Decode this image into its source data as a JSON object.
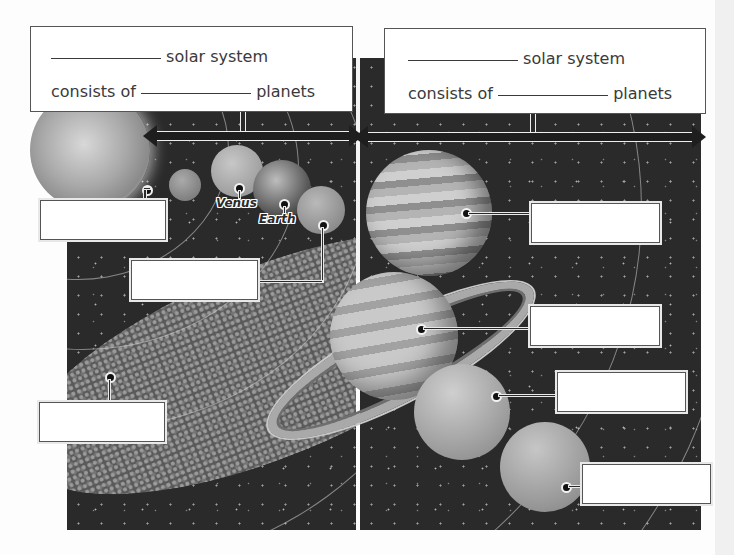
{
  "diagram": {
    "style": "grayscale worksheet",
    "headers": [
      {
        "id": "inner",
        "line1_text": "solar system",
        "line2_prefix": "consists of",
        "line2_suffix": "planets"
      },
      {
        "id": "outer",
        "line1_text": "solar system",
        "line2_prefix": "consists of",
        "line2_suffix": "planets"
      }
    ],
    "planet_labels": [
      {
        "name": "Venus",
        "text": "Venus"
      },
      {
        "name": "Earth",
        "text": "Earth"
      }
    ],
    "blank_label_boxes": [
      {
        "points_to": "mercury",
        "value": ""
      },
      {
        "points_to": "mars",
        "value": ""
      },
      {
        "points_to": "asteroid-belt",
        "value": ""
      },
      {
        "points_to": "jupiter",
        "value": ""
      },
      {
        "points_to": "saturn",
        "value": ""
      },
      {
        "points_to": "uranus",
        "value": ""
      },
      {
        "points_to": "neptune",
        "value": ""
      }
    ],
    "bodies": [
      "sun",
      "mercury",
      "venus",
      "earth",
      "mars",
      "asteroid-belt",
      "jupiter",
      "saturn",
      "uranus",
      "neptune"
    ]
  }
}
